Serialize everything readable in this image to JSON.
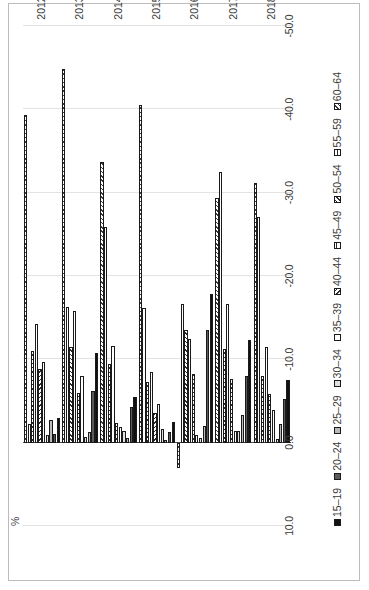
{
  "chart_data": {
    "type": "bar",
    "orientation": "rotated-90",
    "title": "",
    "xlabel": "",
    "ylabel": "%",
    "unit_label": "%",
    "categories": [
      "2012",
      "2013",
      "2014",
      "2015",
      "2016",
      "2017",
      "2018"
    ],
    "ylim": [
      -50.0,
      10.0
    ],
    "yticks": [
      "10.0",
      "0.0",
      "-10.0",
      "-20.0",
      "-30.0",
      "-40.0",
      "-50.0"
    ],
    "ytick_values": [
      10.0,
      0.0,
      -10.0,
      -20.0,
      -30.0,
      -40.0,
      -50.0
    ],
    "grid": true,
    "legend_position": "bottom",
    "series": [
      {
        "name": "15–19",
        "pattern": "solid-black",
        "values": [
          -3.0,
          -10.8,
          -5.5,
          -2.5,
          -17.8,
          -12.3,
          -7.5
        ]
      },
      {
        "name": "20–24",
        "pattern": "solid-darkgrey",
        "values": [
          -1.1,
          -6.2,
          -4.3,
          -1.3,
          -13.5,
          -8.0,
          -5.2
        ]
      },
      {
        "name": "25–29",
        "pattern": "solid-midgrey",
        "values": [
          -2.7,
          -1.3,
          -0.6,
          -0.3,
          -2.0,
          -3.3,
          -2.2
        ]
      },
      {
        "name": "30–34",
        "pattern": "solid-lightgrey",
        "values": [
          -0.9,
          -0.7,
          -1.4,
          -1.6,
          -0.6,
          -1.4,
          -0.5
        ]
      },
      {
        "name": "35–39",
        "pattern": "white",
        "values": [
          -9.7,
          -8.0,
          -1.9,
          -4.6,
          -0.9,
          -1.4,
          -3.9
        ]
      },
      {
        "name": "40–44",
        "pattern": "diagonal-hatch",
        "values": [
          -8.8,
          -6.0,
          -2.4,
          -3.6,
          -8.2,
          -7.6,
          -5.8
        ]
      },
      {
        "name": "45–49",
        "pattern": "vertical-hatch",
        "values": [
          -14.2,
          -15.8,
          -11.6,
          -8.5,
          -12.5,
          -16.7,
          -11.5
        ]
      },
      {
        "name": "50–54",
        "pattern": "reverse-diagonal",
        "values": [
          -11.0,
          -11.5,
          -9.5,
          -7.3,
          -13.5,
          -11.3,
          -8.0
        ]
      },
      {
        "name": "55–59",
        "pattern": "fine-vertical",
        "values": [
          -2.2,
          -16.3,
          -25.9,
          -16.2,
          -16.6,
          -32.5,
          -27.1
        ]
      },
      {
        "name": "60–64",
        "pattern": "cross-hatch",
        "values": [
          -39.3,
          -44.8,
          -33.7,
          -40.5,
          3.0,
          -29.4,
          -31.2
        ]
      }
    ]
  },
  "legend": {
    "items": [
      "15–19",
      "20–24",
      "25–29",
      "30–34",
      "35–39",
      "40–44",
      "45–49",
      "50–54",
      "55–59",
      "60–64"
    ]
  }
}
